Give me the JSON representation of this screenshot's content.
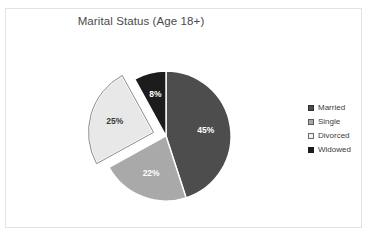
{
  "chart_data": {
    "type": "pie",
    "title": "Marital Status (Age 18+)",
    "categories": [
      "Married",
      "Single",
      "Divorced",
      "Widowed"
    ],
    "values": [
      45,
      22,
      25,
      8
    ],
    "value_labels": [
      "45%",
      "22%",
      "25%",
      "8%"
    ],
    "unit": "percent",
    "colors": [
      "#4d4d4d",
      "#a9a9a9",
      "#e8e8e8",
      "#1c1c1c"
    ],
    "label_text_colors": [
      "#ffffff",
      "#ffffff",
      "#3a3a3a",
      "#ffffff"
    ],
    "exploded_slices": [
      "Divorced"
    ],
    "start_angle_deg": 0,
    "direction": "clockwise",
    "legend_position": "right",
    "grid": false,
    "xlabel": "",
    "ylabel": ""
  },
  "legend": {
    "items": [
      {
        "label": "Married",
        "color": "#4d4d4d",
        "border": "#2f2f2f"
      },
      {
        "label": "Single",
        "color": "#a9a9a9",
        "border": "#5a5a5a"
      },
      {
        "label": "Divorced",
        "color": "#f2f2f2",
        "border": "#6a6a6a"
      },
      {
        "label": "Widowed",
        "color": "#1c1c1c",
        "border": "#1c1c1c"
      }
    ]
  }
}
